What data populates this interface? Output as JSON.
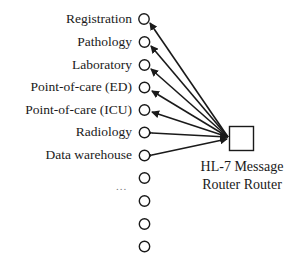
{
  "diagram": {
    "type": "hub-and-spoke",
    "hub": {
      "label_line1": "HL-7 Message",
      "label_line2": "Router Router",
      "shape": "square"
    },
    "nodes": [
      {
        "label": "Registration",
        "direction": "to-node"
      },
      {
        "label": "Pathology",
        "direction": "to-node"
      },
      {
        "label": "Laboratory",
        "direction": "to-node"
      },
      {
        "label": "Point-of-care (ED)",
        "direction": "to-node"
      },
      {
        "label": "Point-of-care (ICU)",
        "direction": "to-node"
      },
      {
        "label": "Radiology",
        "direction": "bidirectional"
      },
      {
        "label": "Data warehouse",
        "direction": "bidirectional"
      },
      {
        "label": "",
        "direction": "none"
      },
      {
        "label": "",
        "direction": "none"
      },
      {
        "label": "",
        "direction": "none"
      },
      {
        "label": "",
        "direction": "none"
      }
    ],
    "ellipsis": "...",
    "colors": {
      "stroke": "#1a1a1a",
      "background": "#ffffff"
    }
  }
}
